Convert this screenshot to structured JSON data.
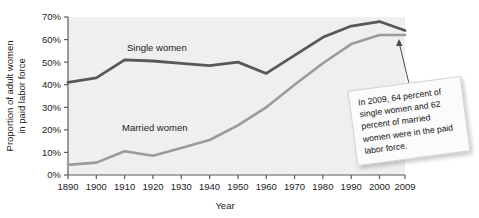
{
  "chart_data": {
    "type": "line",
    "title": "",
    "subtitle": "",
    "xlabel": "Year",
    "ylabel": "Proportion of adult women in paid labor force",
    "ylabel_lines": [
      "Proportion of adult women",
      "in paid labor force"
    ],
    "x": [
      1890,
      1900,
      1910,
      1920,
      1930,
      1940,
      1950,
      1960,
      1970,
      1980,
      1990,
      2000,
      2009
    ],
    "categories": [
      "1890",
      "1900",
      "1910",
      "1920",
      "1930",
      "1940",
      "1950",
      "1960",
      "1970",
      "1980",
      "1990",
      "2000",
      "2009"
    ],
    "xtick_labels": [
      "1890",
      "1900",
      "1910",
      "1920",
      "1930",
      "1940",
      "1950",
      "1960",
      "1970",
      "1980",
      "1990",
      "2000",
      "2009"
    ],
    "ytick_labels": [
      "0%",
      "10%",
      "20%",
      "30%",
      "40%",
      "50%",
      "60%",
      "70%"
    ],
    "ytick_values": [
      0,
      10,
      20,
      30,
      40,
      50,
      60,
      70
    ],
    "ylim": [
      0,
      70
    ],
    "xlim": [
      1890,
      2009
    ],
    "grid": false,
    "legend": "inline-labels",
    "series": [
      {
        "name": "Single women",
        "color": "#58585a",
        "label_text": "Single women",
        "values": [
          41,
          43,
          51,
          50.5,
          49.5,
          48.5,
          50,
          45,
          53,
          61,
          66,
          68,
          64
        ]
      },
      {
        "name": "Married women",
        "color": "#9b9b9d",
        "label_text": "Married women",
        "values": [
          4.5,
          5.5,
          10.5,
          8.5,
          12,
          15.5,
          22,
          30,
          40,
          49.5,
          58,
          62,
          62
        ]
      }
    ],
    "annotations": [
      {
        "name": "callout-2009",
        "text": "In 2009, 64 percent of single women and 62 percent of married women were in the paid labor force.",
        "points_to_x": 2009,
        "points_to_y": 64
      }
    ]
  },
  "labels": {
    "axis_y_line1": "Proportion of adult women",
    "axis_y_line2": "in paid labor force",
    "axis_x": "Year",
    "series_single": "Single women",
    "series_married": "Married women"
  },
  "callout": {
    "text": "In 2009, 64 percent of single women and 62 percent of married women were in the paid labor force."
  },
  "colors": {
    "single_women_line": "#58585a",
    "married_women_line": "#9b9b9d",
    "plot_background": "#efefef",
    "axis": "#5a5a5a",
    "text": "#141414"
  }
}
